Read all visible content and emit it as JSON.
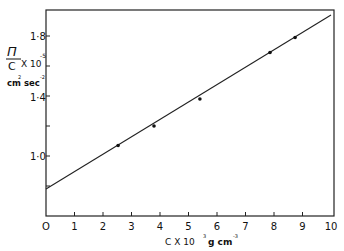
{
  "chart_data": {
    "type": "scatter",
    "title": "",
    "xlabel": "C X 10^3 g cm^-3",
    "ylabel": "Π/C X 10^-5 cm^2 sec^-2",
    "xlim": [
      0,
      10
    ],
    "ylim": [
      0.6,
      1.98
    ],
    "x_ticks": [
      0,
      1,
      2,
      3,
      4,
      5,
      6,
      7,
      8,
      9,
      10
    ],
    "x_tick_labels": [
      "O",
      "1",
      "2",
      "3",
      "4",
      "5",
      "6",
      "7",
      "8",
      "9",
      "10"
    ],
    "y_ticks": [
      0.8,
      1.0,
      1.2,
      1.4,
      1.6,
      1.8
    ],
    "y_tick_labels": [
      "1·0",
      "1·4",
      "1·8"
    ],
    "grid": false,
    "series": [
      {
        "name": "data",
        "x": [
          2.53,
          3.79,
          5.4,
          7.86,
          8.74
        ],
        "y": [
          1.07,
          1.2,
          1.38,
          1.69,
          1.79
        ]
      },
      {
        "name": "fit line",
        "type": "line",
        "x": [
          0,
          10
        ],
        "y": [
          0.78,
          1.94
        ]
      }
    ]
  },
  "labels": {
    "y_main": "Π",
    "y_denom": "C",
    "y_mult": "X 10",
    "y_exp": "-5",
    "y_units": "cm",
    "y_units_exp1": "2",
    "y_units_sec": "sec",
    "y_units_exp2": "-2",
    "x_main": "C  X 10",
    "x_exp": "3",
    "x_units": "g cm",
    "x_units_exp": "-3",
    "tick_y_18": "1·8",
    "tick_y_14": "1·4",
    "tick_y_10": "1·0"
  }
}
